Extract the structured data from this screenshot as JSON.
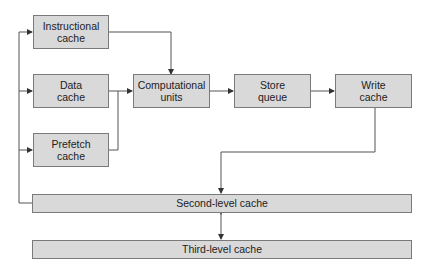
{
  "diagram": {
    "nodes": {
      "instructional_cache": {
        "label": "Instructional\ncache",
        "line1": "Instructional",
        "line2": "cache"
      },
      "data_cache": {
        "line1": "Data",
        "line2": "cache"
      },
      "prefetch_cache": {
        "line1": "Prefetch",
        "line2": "cache"
      },
      "computational_units": {
        "line1": "Computational",
        "line2": "units"
      },
      "store_queue": {
        "line1": "Store",
        "line2": "queue"
      },
      "write_cache": {
        "line1": "Write",
        "line2": "cache"
      },
      "second_level_cache": {
        "label": "Second-level cache"
      },
      "third_level_cache": {
        "label": "Third-level cache"
      }
    },
    "edges": [
      {
        "from": "instructional_cache",
        "to": "computational_units"
      },
      {
        "from": "data_cache",
        "to": "computational_units"
      },
      {
        "from": "prefetch_cache",
        "to": "computational_units"
      },
      {
        "from": "computational_units",
        "to": "store_queue"
      },
      {
        "from": "store_queue",
        "to": "write_cache"
      },
      {
        "from": "write_cache",
        "to": "second_level_cache"
      },
      {
        "from": "second_level_cache",
        "to": "instructional_cache"
      },
      {
        "from": "second_level_cache",
        "to": "data_cache"
      },
      {
        "from": "second_level_cache",
        "to": "prefetch_cache"
      },
      {
        "from": "second_level_cache",
        "to": "third_level_cache",
        "bidirectional": true
      }
    ],
    "colors": {
      "box_fill": "#d9d9d9",
      "box_border": "#7a7a7a",
      "line": "#555555"
    }
  }
}
